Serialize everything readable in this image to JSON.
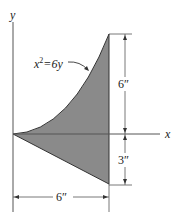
{
  "diagram": {
    "axes": {
      "x_label": "x",
      "y_label": "y"
    },
    "curve_label": {
      "base": "x",
      "exp": "2",
      "rest": "=6y"
    },
    "dimensions": {
      "upper_height": "6″",
      "lower_height": "3″",
      "width": "6″"
    },
    "colors": {
      "fill": "#8a8a8a",
      "stroke": "#333333"
    }
  }
}
